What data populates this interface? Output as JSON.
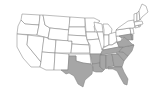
{
  "map": {
    "title": "United States map with highlighted Southern states",
    "colors": {
      "highlight": "#a6a6a6",
      "default": "#ffffff",
      "border": "#7a7a7a",
      "background": "#ffffff"
    },
    "highlighted_states": [
      "TX",
      "AR",
      "LA",
      "MS",
      "AL",
      "TN",
      "GA",
      "FL",
      "SC",
      "NC",
      "VA",
      "MD",
      "DE"
    ],
    "states": [
      {
        "id": "WA",
        "d": "M22,14 L40,15 L39,25 L25,24 L21,20 Z"
      },
      {
        "id": "OR",
        "d": "M21,20 L25,24 L39,25 L37,35 L17,34 L18,26 Z"
      },
      {
        "id": "CA",
        "d": "M17,34 L28,35 L27,45 L41,62 L40,67 L31,67 L23,58 L17,47 Z"
      },
      {
        "id": "ID",
        "d": "M40,15 L43,15 L45,25 L50,28 L48,38 L37,35 L39,25 Z"
      },
      {
        "id": "NV",
        "d": "M28,35 L44,37 L42,55 L41,62 L27,45 Z"
      },
      {
        "id": "MT",
        "d": "M43,15 L70,17 L69,30 L50,28 L45,25 Z"
      },
      {
        "id": "WY",
        "d": "M50,28 L69,30 L68,41 L48,39 Z"
      },
      {
        "id": "UT",
        "d": "M44,37 L48,38 L48,39 L56,40 L55,53 L42,52 Z"
      },
      {
        "id": "AZ",
        "d": "M42,52 L55,53 L54,70 L46,70 L40,67 L41,62 Z"
      },
      {
        "id": "CO",
        "d": "M56,40 L72,41 L71,53 L55,53 Z"
      },
      {
        "id": "NM",
        "d": "M55,53 L69,54 L68,70 L58,70 L54,70 Z"
      },
      {
        "id": "ND",
        "d": "M70,17 L85,18 L85,27 L69,27 Z"
      },
      {
        "id": "SD",
        "d": "M69,27 L85,27 L86,36 L68,35 Z"
      },
      {
        "id": "NE",
        "d": "M68,35 L86,36 L89,45 L72,44 L72,41 L68,41 Z"
      },
      {
        "id": "KS",
        "d": "M72,44 L89,45 L90,53 L71,53 Z"
      },
      {
        "id": "OK",
        "d": "M69,54 L90,54 L91,64 L83,63 L76,61 L76,56 L69,56 Z"
      },
      {
        "id": "TX",
        "d": "M69,56 L76,56 L76,61 L83,63 L91,64 L93,67 L92,74 L85,80 L83,87 L78,84 L74,76 L69,73 L66,74 L61,70 L68,70 Z"
      },
      {
        "id": "MN",
        "d": "M85,18 L94,18 L100,21 L94,26 L95,32 L86,32 Z"
      },
      {
        "id": "IA",
        "d": "M86,32 L97,32 L99,39 L87,40 Z"
      },
      {
        "id": "MO",
        "d": "M87,40 L99,39 L103,48 L101,54 L90,54 L90,45 Z"
      },
      {
        "id": "AR",
        "d": "M90,54 L101,54 L100,63 L92,64 L91,58 Z"
      },
      {
        "id": "LA",
        "d": "M92,64 L100,63 L100,67 L104,70 L102,72 L96,72 L93,71 L93,67 Z"
      },
      {
        "id": "WI",
        "d": "M94,22 L102,24 L103,32 L97,32 L95,28 Z"
      },
      {
        "id": "IL",
        "d": "M97,32 L103,32 L105,44 L102,50 L99,39 Z"
      },
      {
        "id": "MI",
        "d": "M103,24 L108,24 L112,29 L111,35 L104,35 L104,30 Z"
      },
      {
        "id": "IN",
        "d": "M104,35 L109,35 L109,45 L104,47 Z"
      },
      {
        "id": "OH",
        "d": "M109,34 L116,32 L117,41 L112,45 L109,45 Z"
      },
      {
        "id": "KY",
        "d": "M103,48 L109,45 L112,45 L117,42 L119,47 L103,50 Z"
      },
      {
        "id": "TN",
        "d": "M101,53 L103,50 L119,47 L123,47 L119,52 L101,55 Z"
      },
      {
        "id": "MS",
        "d": "M100,55 L106,55 L106,68 L104,70 L100,67 L100,63 Z"
      },
      {
        "id": "AL",
        "d": "M106,55 L112,54 L114,66 L108,67 L107,69 L106,68 Z"
      },
      {
        "id": "GA",
        "d": "M112,54 L118,54 L124,61 L122,67 L115,67 L114,66 Z"
      },
      {
        "id": "FL",
        "d": "M108,67 L115,67 L122,67 L124,72 L128,79 L127,85 L124,84 L120,77 L117,71 L113,69 L108,69 Z"
      },
      {
        "id": "SC",
        "d": "M116,53 L123,52 L128,56 L124,61 L118,54 Z"
      },
      {
        "id": "NC",
        "d": "M119,52 L123,47 L134,45 L132,51 L128,56 L123,52 Z"
      },
      {
        "id": "VA",
        "d": "M117,42 L121,41 L124,37 L128,40 L132,44 L134,45 L123,47 L119,47 Z"
      },
      {
        "id": "WV",
        "d": "M116,36 L119,36 L122,38 L121,41 L117,42 L117,41 Z"
      },
      {
        "id": "PA",
        "d": "M116,30 L130,28 L131,34 L119,36 L116,36 Z"
      },
      {
        "id": "MD",
        "d": "M119,36 L131,34 L132,40 L128,40 L124,37 L122,38 Z"
      },
      {
        "id": "DE",
        "d": "M131,34 L133,35 L133,40 L132,40 Z"
      },
      {
        "id": "NJ",
        "d": "M130,28 L133,28 L134,34 L131,34 Z"
      },
      {
        "id": "NY",
        "d": "M118,28 L128,21 L134,20 L135,27 L133,28 L130,28 L116,30 Z"
      },
      {
        "id": "CT",
        "d": "M135,26 L139,25 L139,27 L135,28 Z"
      },
      {
        "id": "RI",
        "d": "M139,25 L141,25 L140,27 L139,27 Z"
      },
      {
        "id": "MA",
        "d": "M134,22 L142,21 L143,24 L139,25 L135,26 Z"
      },
      {
        "id": "VT",
        "d": "M134,14 L137,13 L137,21 L134,22 Z"
      },
      {
        "id": "NH",
        "d": "M137,13 L139,11 L140,20 L137,21 Z"
      },
      {
        "id": "ME",
        "d": "M139,11 L142,4 L146,6 L148,12 L142,17 L140,20 Z"
      }
    ]
  }
}
